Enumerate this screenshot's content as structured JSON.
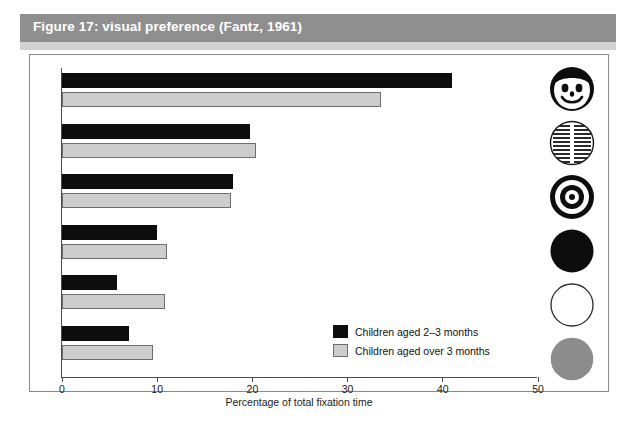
{
  "figure": {
    "title": "Figure 17: visual preference (Fantz, 1961)",
    "title_bar_color": "#8f8f8f",
    "title_text_color": "#ffffff",
    "panel_border_color": "#8a8a8a",
    "background_color": "#ffffff"
  },
  "legend": {
    "position": "inside-bottom-right",
    "items": [
      {
        "label": "Children aged 2–3 months",
        "color": "#0d0d0d",
        "icon": "legend-swatch-dark"
      },
      {
        "label": "Children aged over 3 months",
        "color": "#cdcdcd",
        "icon": "legend-swatch-light"
      }
    ]
  },
  "axis": {
    "x_title": "Percentage of total fixation time",
    "ticks": [
      "0",
      "10",
      "20",
      "30",
      "40",
      "50"
    ]
  },
  "stimuli": [
    {
      "name": "face-icon",
      "label": "face"
    },
    {
      "name": "newsprint-icon",
      "label": "printed matter"
    },
    {
      "name": "bullseye-icon",
      "label": "bullseye"
    },
    {
      "name": "black-circle-icon",
      "label": "plain black disc"
    },
    {
      "name": "white-circle-icon",
      "label": "plain white disc"
    },
    {
      "name": "grey-circle-icon",
      "label": "plain grey disc"
    }
  ],
  "chart_data": {
    "type": "bar",
    "orientation": "horizontal",
    "title": "Figure 17: visual preference (Fantz, 1961)",
    "xlabel": "Percentage of total fixation time",
    "ylabel": "",
    "xlim": [
      0,
      50
    ],
    "xticks": [
      0,
      10,
      20,
      30,
      40,
      50
    ],
    "grid": false,
    "legend_position": "inside-bottom-right",
    "categories": [
      "face",
      "printed matter",
      "bullseye",
      "plain black disc",
      "plain white disc",
      "plain grey disc"
    ],
    "series": [
      {
        "name": "Children aged 2–3 months",
        "color": "#0d0d0d",
        "values": [
          41.0,
          19.8,
          18.0,
          10.0,
          5.8,
          7.0
        ]
      },
      {
        "name": "Children aged over 3 months",
        "color": "#cdcdcd",
        "values": [
          33.5,
          20.4,
          17.7,
          11.0,
          10.8,
          9.6
        ]
      }
    ]
  }
}
